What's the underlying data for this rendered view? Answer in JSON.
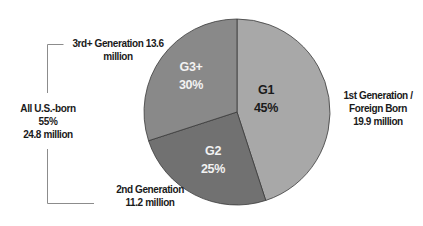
{
  "chart_data": {
    "type": "pie",
    "title": "",
    "slices": [
      {
        "key": "G1",
        "label": "G1",
        "percent_label": "45%",
        "value": 45,
        "color": "#a8a8a8",
        "text_color": "#1a1a1a",
        "description": [
          "1st Generation /",
          "Foreign Born",
          "19.9 million"
        ],
        "population_millions": 19.9
      },
      {
        "key": "G2",
        "label": "G2",
        "percent_label": "25%",
        "value": 25,
        "color": "#717171",
        "text_color": "#f2f2f2",
        "description": [
          "2nd Generation",
          "11.2 million"
        ],
        "population_millions": 11.2
      },
      {
        "key": "G3",
        "label": "G3+",
        "percent_label": "30%",
        "value": 30,
        "color": "#898989",
        "text_color": "#f2f2f2",
        "description": [
          "3rd+ Generation 13.6",
          "million"
        ],
        "population_millions": 13.6
      }
    ],
    "start_angle_deg": 0,
    "direction": "clockwise",
    "bracket_annotation": {
      "lines": [
        "All U.S.-born",
        "55%",
        "24.8 million"
      ],
      "groups": [
        "G2",
        "G3+"
      ],
      "percent": 55,
      "population_millions": 24.8
    },
    "legend": "none (external labels)"
  }
}
